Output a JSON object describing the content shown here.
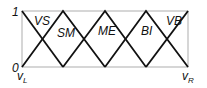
{
  "diagram": {
    "type": "fuzzy-membership-functions",
    "y_axis": {
      "top_label": "1",
      "bottom_label": "0"
    },
    "x_axis": {
      "left_label": "v",
      "left_sub": "L",
      "right_label": "v",
      "right_sub": "R"
    },
    "sets": [
      {
        "label": "VS",
        "shape": "left-shoulder",
        "peak_index": 0
      },
      {
        "label": "SM",
        "shape": "triangle",
        "peak_index": 1
      },
      {
        "label": "ME",
        "shape": "triangle",
        "peak_index": 2
      },
      {
        "label": "BI",
        "shape": "triangle",
        "peak_index": 3
      },
      {
        "label": "VB",
        "shape": "right-shoulder",
        "peak_index": 4
      }
    ],
    "colors": {
      "line": "#111111",
      "frame": "#999999"
    }
  }
}
